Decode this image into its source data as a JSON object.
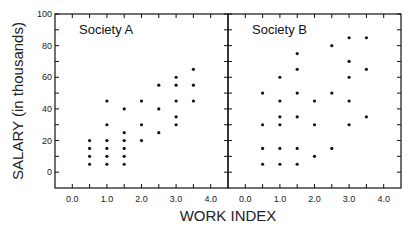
{
  "chart_data": {
    "type": "scatter",
    "ylabel": "SALARY (in thousands)",
    "xlabel": "WORK INDEX",
    "ylim": [
      -10,
      100
    ],
    "xlim": [
      -0.5,
      4.5
    ],
    "y_ticks": [
      "0",
      "20",
      "40",
      "60",
      "80",
      "100"
    ],
    "x_ticks": [
      "0.0",
      "1.0",
      "2.0",
      "3.0",
      "4.0"
    ],
    "grid": false,
    "panels": [
      {
        "title": "Society A",
        "points": [
          [
            0.5,
            20
          ],
          [
            0.5,
            15
          ],
          [
            0.5,
            10
          ],
          [
            0.5,
            5
          ],
          [
            1.0,
            45
          ],
          [
            1.0,
            30
          ],
          [
            1.0,
            20
          ],
          [
            1.0,
            15
          ],
          [
            1.0,
            10
          ],
          [
            1.0,
            5
          ],
          [
            1.5,
            40
          ],
          [
            1.5,
            25
          ],
          [
            1.5,
            20
          ],
          [
            1.5,
            15
          ],
          [
            1.5,
            10
          ],
          [
            1.5,
            5
          ],
          [
            2.0,
            45
          ],
          [
            2.0,
            30
          ],
          [
            2.0,
            20
          ],
          [
            2.5,
            55
          ],
          [
            2.5,
            40
          ],
          [
            2.5,
            25
          ],
          [
            3.0,
            60
          ],
          [
            3.0,
            55
          ],
          [
            3.0,
            45
          ],
          [
            3.0,
            35
          ],
          [
            3.0,
            30
          ],
          [
            3.5,
            65
          ],
          [
            3.5,
            55
          ],
          [
            3.5,
            45
          ]
        ]
      },
      {
        "title": "Society B",
        "points": [
          [
            0.5,
            50
          ],
          [
            0.5,
            30
          ],
          [
            0.5,
            15
          ],
          [
            0.5,
            5
          ],
          [
            1.0,
            60
          ],
          [
            1.0,
            45
          ],
          [
            1.0,
            35
          ],
          [
            1.0,
            30
          ],
          [
            1.0,
            15
          ],
          [
            1.0,
            5
          ],
          [
            1.5,
            75
          ],
          [
            1.5,
            65
          ],
          [
            1.5,
            50
          ],
          [
            1.5,
            35
          ],
          [
            1.5,
            15
          ],
          [
            1.5,
            5
          ],
          [
            2.0,
            45
          ],
          [
            2.0,
            30
          ],
          [
            2.0,
            10
          ],
          [
            2.5,
            80
          ],
          [
            2.5,
            50
          ],
          [
            2.5,
            15
          ],
          [
            3.0,
            85
          ],
          [
            3.0,
            70
          ],
          [
            3.0,
            60
          ],
          [
            3.0,
            45
          ],
          [
            3.0,
            30
          ],
          [
            3.5,
            85
          ],
          [
            3.5,
            65
          ],
          [
            3.5,
            35
          ]
        ]
      }
    ]
  }
}
